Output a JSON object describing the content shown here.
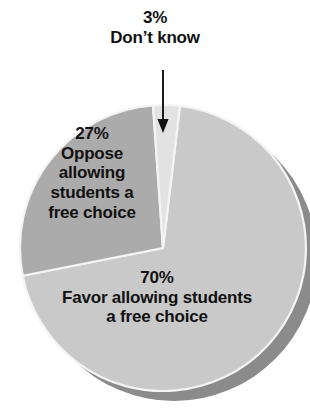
{
  "chart_data": {
    "type": "pie",
    "title": "",
    "subtitle": "",
    "xlabel": "",
    "ylabel": "",
    "grid": false,
    "legend_position": "none",
    "units": "percent",
    "total": 100,
    "style": {
      "background": "#ffffff",
      "text_color": "#111111",
      "shadow_color": "#8b8b8b",
      "edge_color": "#f2f2f2"
    },
    "geometry": {
      "center_x": 163,
      "center_y": 248,
      "radius": 143,
      "depth_offset_x": 11,
      "depth_offset_y": 10,
      "start_angle_deg": -94
    },
    "categories": [
      "Favor allowing students a free choice",
      "Oppose allowing students a free choice",
      "Don't know"
    ],
    "values": [
      70,
      27,
      3
    ],
    "slices": [
      {
        "name": "favor",
        "value": 70,
        "value_label": "70%",
        "category": "Favor allowing students a free choice",
        "color": "#c9c9c9",
        "label_lines": [
          "70%",
          "Favor allowing students",
          "a free choice"
        ],
        "label_placement": "inside"
      },
      {
        "name": "oppose",
        "value": 27,
        "value_label": "27%",
        "category": "Oppose allowing students a free choice",
        "color": "#ababab",
        "label_lines": [
          "27%",
          "Oppose",
          "allowing",
          "students a",
          "free choice"
        ],
        "label_placement": "inside"
      },
      {
        "name": "dont-know",
        "value": 3,
        "value_label": "3%",
        "category": "Don't know",
        "color": "#e2e2e2",
        "label_lines": [
          "3%",
          "Don’t know"
        ],
        "label_placement": "callout-above",
        "callout": {
          "arrow": "down-arrow-icon",
          "arrow_from_y": 70,
          "arrow_to_y": 133,
          "arrow_x": 163
        }
      }
    ]
  },
  "callout": {
    "percent": "3%",
    "description": "Don’t know",
    "arrow_icon": "down-arrow-icon"
  },
  "oppose_label": {
    "percent": "27%",
    "line1": "Oppose",
    "line2": "allowing",
    "line3": "students a",
    "line4": "free choice"
  },
  "favor_label": {
    "percent": "70%",
    "line1": "Favor allowing students",
    "line2": "a free choice"
  }
}
